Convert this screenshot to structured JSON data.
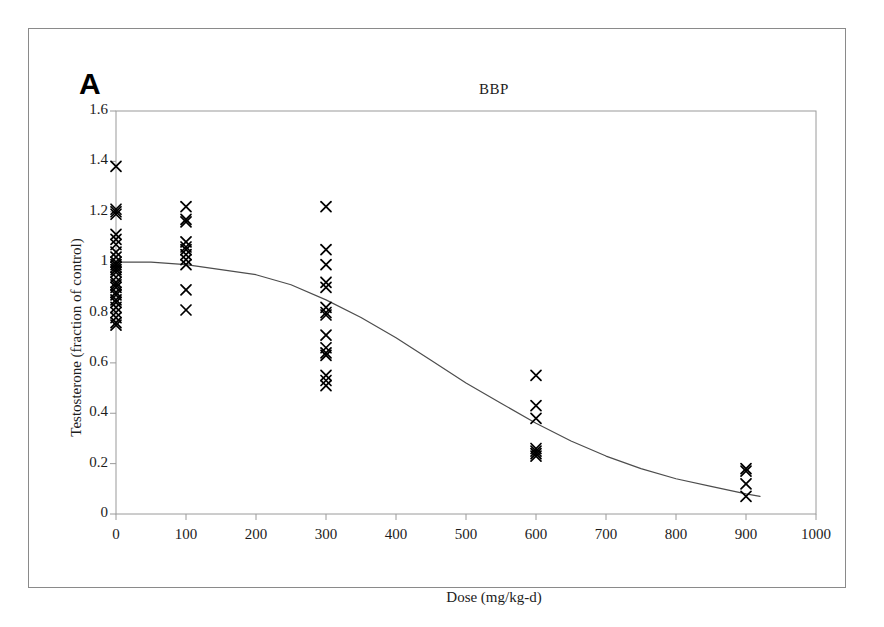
{
  "figure": {
    "panel_label": "A",
    "title": "BBP"
  },
  "chart_data": {
    "type": "scatter",
    "title": "BBP",
    "panel": "A",
    "xlabel": "Dose (mg/kg-d)",
    "ylabel": "Testosterone (fraction of control)",
    "xlim": [
      0,
      1000
    ],
    "ylim": [
      0,
      1.6
    ],
    "xticks": [
      0,
      100,
      200,
      300,
      400,
      500,
      600,
      700,
      800,
      900,
      1000
    ],
    "xtick_labels": [
      "0",
      "100",
      "200",
      "300",
      "400",
      "500",
      "600",
      "700",
      "800",
      "900",
      "1000"
    ],
    "yticks": [
      0,
      0.2,
      0.4,
      0.6,
      0.8,
      1.0,
      1.2,
      1.4,
      1.6
    ],
    "ytick_labels": [
      "0",
      "0.2",
      "0.4",
      "0.6",
      "0.8",
      "1",
      "1.2",
      "1.4",
      "1.6"
    ],
    "grid": false,
    "legend": false,
    "marker": "x",
    "marker_color": "#000000",
    "curve_color": "#4d4d4d",
    "series": [
      {
        "name": "Testosterone observations",
        "marker": "x",
        "points": [
          {
            "x": 0,
            "y": 1.38
          },
          {
            "x": 0,
            "y": 1.21
          },
          {
            "x": 0,
            "y": 1.2
          },
          {
            "x": 0,
            "y": 1.19
          },
          {
            "x": 0,
            "y": 1.11
          },
          {
            "x": 0,
            "y": 1.09
          },
          {
            "x": 0,
            "y": 1.07
          },
          {
            "x": 0,
            "y": 1.04
          },
          {
            "x": 0,
            "y": 1.02
          },
          {
            "x": 0,
            "y": 1.0
          },
          {
            "x": 0,
            "y": 0.99
          },
          {
            "x": 0,
            "y": 0.98
          },
          {
            "x": 0,
            "y": 0.97
          },
          {
            "x": 0,
            "y": 0.96
          },
          {
            "x": 0,
            "y": 0.94
          },
          {
            "x": 0,
            "y": 0.92
          },
          {
            "x": 0,
            "y": 0.91
          },
          {
            "x": 0,
            "y": 0.9
          },
          {
            "x": 0,
            "y": 0.88
          },
          {
            "x": 0,
            "y": 0.87
          },
          {
            "x": 0,
            "y": 0.85
          },
          {
            "x": 0,
            "y": 0.84
          },
          {
            "x": 0,
            "y": 0.82
          },
          {
            "x": 0,
            "y": 0.8
          },
          {
            "x": 0,
            "y": 0.78
          },
          {
            "x": 0,
            "y": 0.76
          },
          {
            "x": 0,
            "y": 0.75
          },
          {
            "x": 100,
            "y": 1.22
          },
          {
            "x": 100,
            "y": 1.17
          },
          {
            "x": 100,
            "y": 1.16
          },
          {
            "x": 100,
            "y": 1.08
          },
          {
            "x": 100,
            "y": 1.06
          },
          {
            "x": 100,
            "y": 1.05
          },
          {
            "x": 100,
            "y": 1.03
          },
          {
            "x": 100,
            "y": 1.01
          },
          {
            "x": 100,
            "y": 0.99
          },
          {
            "x": 100,
            "y": 0.89
          },
          {
            "x": 100,
            "y": 0.81
          },
          {
            "x": 300,
            "y": 1.22
          },
          {
            "x": 300,
            "y": 1.05
          },
          {
            "x": 300,
            "y": 0.99
          },
          {
            "x": 300,
            "y": 0.92
          },
          {
            "x": 300,
            "y": 0.9
          },
          {
            "x": 300,
            "y": 0.82
          },
          {
            "x": 300,
            "y": 0.8
          },
          {
            "x": 300,
            "y": 0.79
          },
          {
            "x": 300,
            "y": 0.71
          },
          {
            "x": 300,
            "y": 0.66
          },
          {
            "x": 300,
            "y": 0.64
          },
          {
            "x": 300,
            "y": 0.63
          },
          {
            "x": 300,
            "y": 0.55
          },
          {
            "x": 300,
            "y": 0.53
          },
          {
            "x": 300,
            "y": 0.51
          },
          {
            "x": 600,
            "y": 0.55
          },
          {
            "x": 600,
            "y": 0.43
          },
          {
            "x": 600,
            "y": 0.38
          },
          {
            "x": 600,
            "y": 0.26
          },
          {
            "x": 600,
            "y": 0.25
          },
          {
            "x": 600,
            "y": 0.24
          },
          {
            "x": 600,
            "y": 0.23
          },
          {
            "x": 900,
            "y": 0.18
          },
          {
            "x": 900,
            "y": 0.17
          },
          {
            "x": 900,
            "y": 0.12
          },
          {
            "x": 900,
            "y": 0.07
          }
        ]
      }
    ],
    "fitted_curve": {
      "name": "Fitted dose-response curve",
      "x": [
        0,
        50,
        100,
        150,
        200,
        250,
        300,
        350,
        400,
        450,
        500,
        550,
        600,
        650,
        700,
        750,
        800,
        850,
        900,
        920
      ],
      "y": [
        1.0,
        1.0,
        0.99,
        0.97,
        0.95,
        0.91,
        0.85,
        0.78,
        0.7,
        0.61,
        0.52,
        0.44,
        0.36,
        0.29,
        0.23,
        0.18,
        0.14,
        0.11,
        0.08,
        0.07
      ]
    }
  }
}
